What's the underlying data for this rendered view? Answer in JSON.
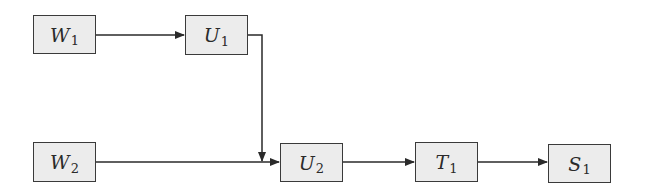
{
  "diagram": {
    "type": "block-flow",
    "nodes": [
      {
        "id": "W1",
        "base": "W",
        "sub": "1"
      },
      {
        "id": "U1",
        "base": "U",
        "sub": "1"
      },
      {
        "id": "W2",
        "base": "W",
        "sub": "2"
      },
      {
        "id": "U2",
        "base": "U",
        "sub": "2"
      },
      {
        "id": "T1",
        "base": "T",
        "sub": "1"
      },
      {
        "id": "S1",
        "base": "S",
        "sub": "1"
      }
    ],
    "edges": [
      {
        "from": "W1",
        "to": "U1"
      },
      {
        "from": "U1",
        "to": "U2"
      },
      {
        "from": "W2",
        "to": "U2"
      },
      {
        "from": "U2",
        "to": "T1"
      },
      {
        "from": "T1",
        "to": "S1"
      }
    ],
    "colors": {
      "box_fill": "#ececec",
      "stroke": "#3a3a3a"
    }
  }
}
